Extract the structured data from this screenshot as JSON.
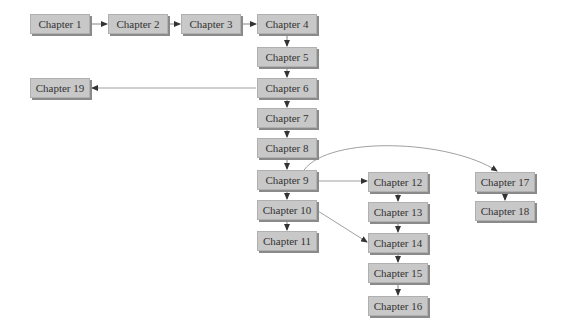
{
  "diagram": {
    "type": "chapter-dependency-flowchart",
    "nodes": [
      {
        "id": "c1",
        "label": "Chapter 1",
        "x": 30,
        "y": 14
      },
      {
        "id": "c2",
        "label": "Chapter 2",
        "x": 108,
        "y": 14
      },
      {
        "id": "c3",
        "label": "Chapter 3",
        "x": 181,
        "y": 14
      },
      {
        "id": "c4",
        "label": "Chapter 4",
        "x": 257,
        "y": 14
      },
      {
        "id": "c5",
        "label": "Chapter 5",
        "x": 257,
        "y": 47
      },
      {
        "id": "c6",
        "label": "Chapter 6",
        "x": 257,
        "y": 78
      },
      {
        "id": "c7",
        "label": "Chapter 7",
        "x": 257,
        "y": 108
      },
      {
        "id": "c8",
        "label": "Chapter 8",
        "x": 257,
        "y": 138
      },
      {
        "id": "c9",
        "label": "Chapter 9",
        "x": 257,
        "y": 170
      },
      {
        "id": "c10",
        "label": "Chapter 10",
        "x": 257,
        "y": 200
      },
      {
        "id": "c11",
        "label": "Chapter 11",
        "x": 257,
        "y": 231
      },
      {
        "id": "c19",
        "label": "Chapter 19",
        "x": 30,
        "y": 78
      },
      {
        "id": "c12",
        "label": "Chapter 12",
        "x": 368,
        "y": 172
      },
      {
        "id": "c13",
        "label": "Chapter 13",
        "x": 368,
        "y": 202
      },
      {
        "id": "c14",
        "label": "Chapter 14",
        "x": 368,
        "y": 233
      },
      {
        "id": "c15",
        "label": "Chapter 15",
        "x": 368,
        "y": 263
      },
      {
        "id": "c16",
        "label": "Chapter 16",
        "x": 368,
        "y": 296
      },
      {
        "id": "c17",
        "label": "Chapter 17",
        "x": 475,
        "y": 172
      },
      {
        "id": "c18",
        "label": "Chapter 18",
        "x": 475,
        "y": 201
      }
    ],
    "edges": [
      {
        "from": "c1",
        "to": "c2"
      },
      {
        "from": "c2",
        "to": "c3"
      },
      {
        "from": "c3",
        "to": "c4"
      },
      {
        "from": "c4",
        "to": "c5"
      },
      {
        "from": "c5",
        "to": "c6"
      },
      {
        "from": "c6",
        "to": "c19"
      },
      {
        "from": "c6",
        "to": "c7"
      },
      {
        "from": "c7",
        "to": "c8"
      },
      {
        "from": "c8",
        "to": "c9"
      },
      {
        "from": "c9",
        "to": "c10"
      },
      {
        "from": "c9",
        "to": "c12"
      },
      {
        "from": "c9",
        "to": "c17",
        "curved": true
      },
      {
        "from": "c10",
        "to": "c11"
      },
      {
        "from": "c10",
        "to": "c14"
      },
      {
        "from": "c12",
        "to": "c13"
      },
      {
        "from": "c13",
        "to": "c14"
      },
      {
        "from": "c14",
        "to": "c15"
      },
      {
        "from": "c15",
        "to": "c16"
      },
      {
        "from": "c17",
        "to": "c18"
      }
    ],
    "colors": {
      "box_fill": "#c8c8c8",
      "box_shadow": "#8a8a8a",
      "edge": "#555555",
      "text": "#333333"
    }
  }
}
